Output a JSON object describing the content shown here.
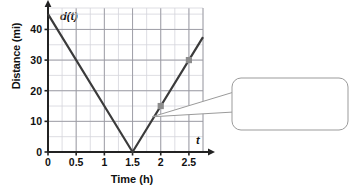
{
  "chart_data": {
    "type": "line",
    "title": "",
    "xlabel": "Time (h)",
    "ylabel": "Distance (mi)",
    "x_axis_name": "t",
    "y_axis_name": "d(t)",
    "xlim": [
      0,
      2.75
    ],
    "ylim": [
      0,
      47
    ],
    "xticks": [
      "0",
      "0.5",
      "1",
      "1.5",
      "2",
      "2.5"
    ],
    "xtick_values": [
      0,
      0.5,
      1,
      1.5,
      2,
      2.5
    ],
    "yticks": [
      "0",
      "10",
      "20",
      "30",
      "40"
    ],
    "ytick_values": [
      0,
      10,
      20,
      30,
      40
    ],
    "grid": true,
    "grid_major_step_x": 0.5,
    "grid_major_step_y": 10,
    "grid_minor_step_x": 0.25,
    "grid_minor_step_y": 5,
    "legend": null,
    "series": [
      {
        "name": "d(t)",
        "color": "#3b3b3b",
        "points": [
          {
            "x": 0,
            "y": 45
          },
          {
            "x": 1.5,
            "y": 0
          },
          {
            "x": 2.75,
            "y": 37.5
          }
        ]
      }
    ],
    "markers": [
      {
        "x": 2,
        "y": 15,
        "color": "#8c8c8c"
      },
      {
        "x": 2.5,
        "y": 30,
        "color": "#8c8c8c"
      }
    ],
    "annotations": [
      {
        "name": "slope-callout",
        "text": "For this section of the graph, the slope is constant.",
        "lines": [
          "For this section",
          "of the graph, the",
          "slope is constant."
        ],
        "target_x": 1.85,
        "target_y": 11.5
      }
    ]
  },
  "colors": {
    "line": "#3b3b3b",
    "marker": "#8c8c8c",
    "grid_major": "#9a9aa2",
    "grid_minor": "#d6d6dc",
    "axis": "#222222",
    "callout_border": "#9b9b9b",
    "callout_fill": "#ffffff",
    "text": "#111111",
    "background": "#ffffff"
  }
}
